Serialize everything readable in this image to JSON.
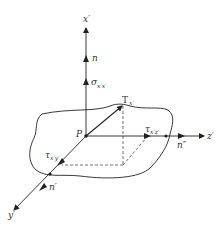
{
  "figure": {
    "labels": {
      "x_axis": "x′",
      "y_axis": "y′",
      "z_axis": "z′",
      "normal_n": "n",
      "normal_n_prime": "n′",
      "normal_n_double_prime": "n″",
      "point": "P",
      "sigma": "σ",
      "sigma_sub": "x′x′",
      "traction": "T",
      "traction_sub": "x′",
      "tau_xz": "τ",
      "tau_xz_sub": "x′z′",
      "tau_xy": "τ",
      "tau_xy_sub": "x′y′"
    },
    "colors": {
      "ink": "#222222",
      "background": "#ffffff"
    }
  }
}
